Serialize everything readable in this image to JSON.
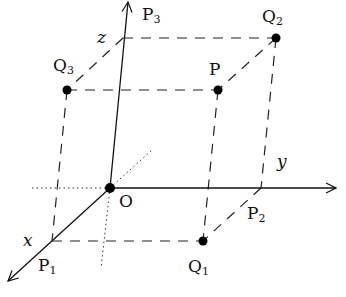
{
  "diagram": {
    "colors": {
      "ink": "#111111",
      "background": "#ffffff"
    },
    "origin": {
      "label": "O",
      "x": 110,
      "y": 188
    },
    "axes": [
      {
        "name": "x",
        "label": "x",
        "from": [
          110,
          188
        ],
        "to": [
          8,
          281
        ]
      },
      {
        "name": "y",
        "label": "y",
        "from": [
          110,
          188
        ],
        "to": [
          336,
          188
        ]
      },
      {
        "name": "z",
        "label": "z",
        "from": [
          110,
          188
        ],
        "to": [
          128,
          2
        ]
      }
    ],
    "points": [
      {
        "id": "P",
        "label": "P",
        "sub": "",
        "x": 218,
        "y": 90
      },
      {
        "id": "Q1",
        "label": "Q",
        "sub": "1",
        "x": 203,
        "y": 241
      },
      {
        "id": "Q2",
        "label": "Q",
        "sub": "2",
        "x": 276,
        "y": 38
      },
      {
        "id": "Q3",
        "label": "Q",
        "sub": "3",
        "x": 67,
        "y": 90
      }
    ],
    "axis_points": [
      {
        "id": "P1",
        "label": "P",
        "sub": "1",
        "x": 52,
        "y": 241
      },
      {
        "id": "P2",
        "label": "P",
        "sub": "2",
        "x": 261,
        "y": 188
      },
      {
        "id": "P3",
        "label": "P",
        "sub": "3",
        "x": 123,
        "y": 38
      }
    ],
    "labels": {
      "x_axis": "x",
      "y_axis": "y",
      "z_axis": "z",
      "origin": "O",
      "P": "P",
      "P1": "P",
      "P1_sub": "1",
      "P2": "P",
      "P2_sub": "2",
      "P3": "P",
      "P3_sub": "3",
      "Q1": "Q",
      "Q1_sub": "1",
      "Q2": "Q",
      "Q2_sub": "2",
      "Q3": "Q",
      "Q3_sub": "3"
    }
  }
}
